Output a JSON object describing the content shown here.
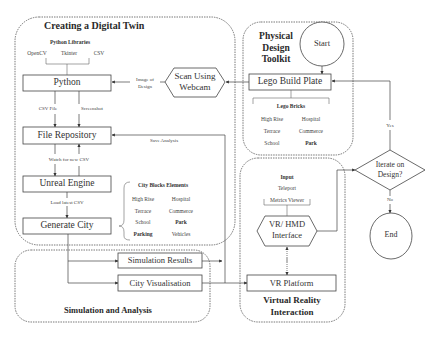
{
  "groups": {
    "digital_twin": {
      "title": "Creating a Digital Twin"
    },
    "physical_toolkit": {
      "title_lines": [
        "Physical",
        "Design",
        "Toolkit"
      ]
    },
    "vr_interaction": {
      "title_lines": [
        "Virtual Reality",
        "Interaction"
      ]
    },
    "simulation": {
      "title": "Simulation and Analysis"
    }
  },
  "nodes": {
    "python": "Python",
    "scan_webcam": [
      "Scan Using",
      "Webcam"
    ],
    "lego_plate": "Lego Build Plate",
    "start": "Start",
    "file_repo": "File Repository",
    "unreal": "Unreal Engine",
    "generate_city": "Generate City",
    "sim_results": "Simulation Results",
    "city_vis": "City Visualisation",
    "vr_hmd": [
      "VR/ HMD",
      "Interface"
    ],
    "vr_platform": "VR Platform",
    "iterate": [
      "Iterate on",
      "Design?"
    ],
    "end": "End"
  },
  "python_libraries": {
    "title": "Python Libraries",
    "items": [
      "OpenCV",
      "Tkinter",
      "CSV"
    ]
  },
  "lego_bricks": {
    "title": "Lego Bricks",
    "items": [
      [
        "High Rise",
        "Hospital"
      ],
      [
        "Terrace",
        "Commerce"
      ],
      [
        "School",
        "Park"
      ]
    ]
  },
  "city_blocks": {
    "title": "City Blocks Elements",
    "items": [
      [
        "High Rise",
        "Hospital"
      ],
      [
        "Terrace",
        "Commerce"
      ],
      [
        "School",
        "Park"
      ],
      [
        "Parking",
        "Vehicles"
      ]
    ]
  },
  "vr_input": {
    "title": "Input",
    "items": [
      "Teleport",
      "Metrics Viewer"
    ]
  },
  "edge_labels": {
    "image_of_design": [
      "Image of",
      "Design"
    ],
    "csv_file": "CSV File",
    "screenshot": "Screenshot",
    "save_analysis": "Save Analysis",
    "watch_csv": "Watch for new CSV",
    "load_csv": "Load latest CSV",
    "yes": "Yes",
    "no": "No"
  }
}
